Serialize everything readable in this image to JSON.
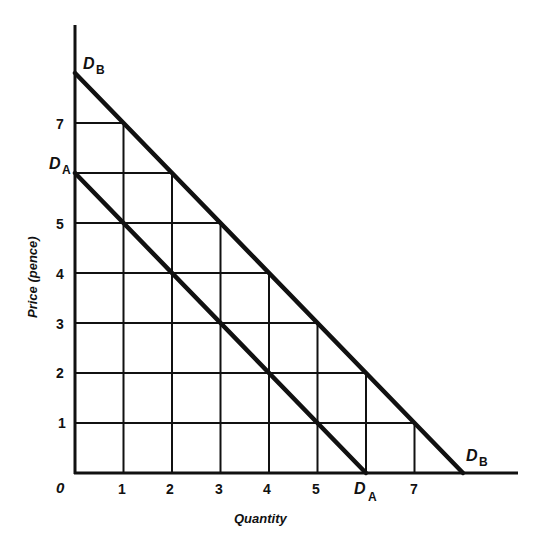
{
  "chart_data": {
    "type": "line",
    "title": "",
    "xlabel": "Quantity",
    "ylabel": "Price (pence)",
    "xlim": [
      0,
      9
    ],
    "ylim": [
      0,
      9
    ],
    "grid": true,
    "grid_style": "staircase grid bounded by D_B",
    "x_ticks": [
      "0",
      "1",
      "2",
      "3",
      "4",
      "5",
      "D_A",
      "7"
    ],
    "y_ticks": [
      "1",
      "2",
      "3",
      "4",
      "5",
      "D_A",
      "7"
    ],
    "origin_label": "0",
    "series": [
      {
        "name": "D_A",
        "label_main": "D",
        "label_sub": "A",
        "x": [
          0,
          1,
          2,
          3,
          4,
          5,
          6
        ],
        "y": [
          6,
          5,
          4,
          3,
          2,
          1,
          0
        ]
      },
      {
        "name": "D_B",
        "label_main": "D",
        "label_sub": "B",
        "x": [
          0,
          1,
          2,
          3,
          4,
          5,
          6,
          7,
          8
        ],
        "y": [
          8,
          7,
          6,
          5,
          4,
          3,
          2,
          1,
          0
        ]
      }
    ]
  },
  "labels": {
    "origin": "0",
    "x_axis": "Quantity",
    "y_axis": "Price (pence)",
    "x_ticks": [
      "1",
      "2",
      "3",
      "4",
      "5",
      "7"
    ],
    "y_ticks": [
      "1",
      "2",
      "3",
      "4",
      "5",
      "7"
    ],
    "da_main": "D",
    "da_sub": "A",
    "db_main": "D",
    "db_sub": "B"
  }
}
